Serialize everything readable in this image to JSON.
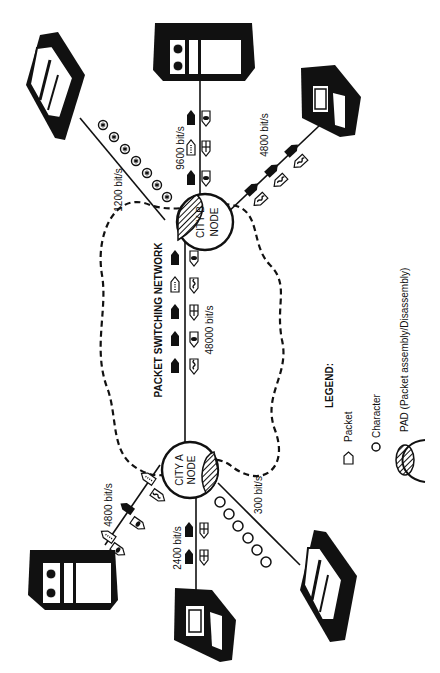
{
  "diagram": {
    "title": "PACKET SWITCHING NETWORK",
    "nodes": {
      "city_a": {
        "line1": "CITY A",
        "line2": "NODE"
      },
      "city_b": {
        "line1": "CITY B",
        "line2": "NODE"
      }
    },
    "links": {
      "trunk": "48000 bit/s",
      "b_printer": "1200 bit/s",
      "b_host": "9600 bit/s",
      "b_terminal": "4800 bit/s",
      "a_host": "4800 bit/s",
      "a_terminal": "2400 bit/s",
      "a_printer": "300 bit/s"
    },
    "legend": {
      "heading": "LEGEND:",
      "packet": "Packet",
      "character": "Character",
      "pad": "PAD (Packet assembly/Disassembly)"
    },
    "colors": {
      "ink": "#111111",
      "paper": "#ffffff"
    }
  }
}
